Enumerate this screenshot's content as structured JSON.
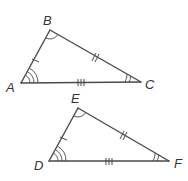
{
  "diagram": {
    "colors": {
      "stroke": "#4a4a4a",
      "label": "#333333",
      "background": "#ffffff"
    },
    "triangles": [
      {
        "name": "ABC",
        "vertices": [
          {
            "label": "A",
            "x": 21,
            "y": 83
          },
          {
            "label": "B",
            "x": 50,
            "y": 30
          },
          {
            "label": "C",
            "x": 141,
            "y": 82
          }
        ],
        "side_marks": {
          "AB": 1,
          "BC": 2,
          "AC": 3
        },
        "angle_marks": {
          "A": 3,
          "B": 1,
          "C": 2
        }
      },
      {
        "name": "DEF",
        "vertices": [
          {
            "label": "D",
            "x": 49,
            "y": 161
          },
          {
            "label": "E",
            "x": 78,
            "y": 108
          },
          {
            "label": "F",
            "x": 169,
            "y": 161
          }
        ],
        "side_marks": {
          "DE": 1,
          "EF": 2,
          "DF": 3
        },
        "angle_marks": {
          "D": 3,
          "E": 1,
          "F": 2
        }
      }
    ]
  },
  "labels": {
    "A": "A",
    "B": "B",
    "C": "C",
    "D": "D",
    "E": "E",
    "F": "F"
  }
}
